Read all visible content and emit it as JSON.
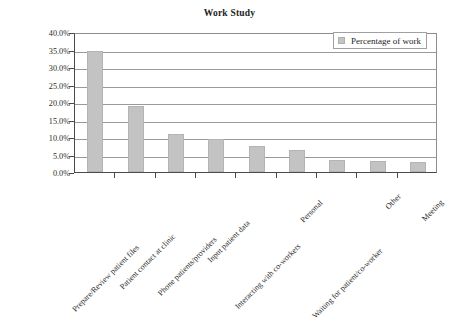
{
  "chart_data": {
    "type": "bar",
    "title": "Work Study",
    "xlabel": "",
    "ylabel": "",
    "ylim": [
      0,
      40
    ],
    "ytick_values": [
      0,
      5,
      10,
      15,
      20,
      25,
      30,
      35,
      40
    ],
    "ytick_labels": [
      "0.0%",
      "5.0%",
      "10.0%",
      "15.0%",
      "20.0%",
      "25.0%",
      "30.0%",
      "35.0%",
      "40.0%"
    ],
    "grid": true,
    "legend_position": "top-right",
    "categories": [
      "Prepare/Review patient files",
      "Patient contact at clinic",
      "Phone patients/providers",
      "Input patient data",
      "Interacting with co-workers",
      "Personal",
      "Waiting for patient/co-worker",
      "Other",
      "Meeting"
    ],
    "series": [
      {
        "name": "Percentage of work",
        "color": "#c3c3c3",
        "values": [
          34.5,
          19.0,
          11.0,
          9.5,
          7.5,
          6.3,
          3.5,
          3.2,
          3.0
        ]
      }
    ]
  },
  "legend": {
    "marker_name": "legend-swatch",
    "label": "Percentage of work"
  }
}
